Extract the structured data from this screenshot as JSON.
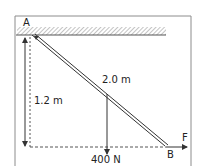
{
  "diagram": {
    "type": "statics-beam",
    "labels": {
      "point_a": "A",
      "point_b": "B",
      "beam_length": "2.0 m",
      "height": "1.2 m",
      "load": "400 N",
      "force": "F"
    },
    "colors": {
      "line": "#333333",
      "frame": "#888888",
      "hatch": "#999999",
      "background": "#ffffff"
    }
  }
}
